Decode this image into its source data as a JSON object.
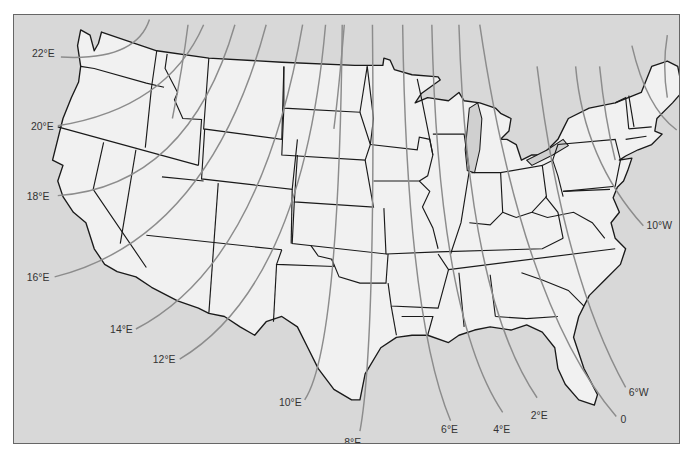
{
  "map": {
    "title": "Magnetic declination (isogonic lines), contiguous United States",
    "colors": {
      "water": "#d8d8d8",
      "land": "#f1f1f1",
      "border": "#1a1a1a",
      "isogonic_line": "#8c8c8c",
      "label": "#333333"
    },
    "isogonic_lines": [
      {
        "id": "22E",
        "label": "22°E",
        "declination_deg": 22,
        "direction": "E"
      },
      {
        "id": "20E",
        "label": "20°E",
        "declination_deg": 20,
        "direction": "E"
      },
      {
        "id": "18E",
        "label": "18°E",
        "declination_deg": 18,
        "direction": "E"
      },
      {
        "id": "16E",
        "label": "16°E",
        "declination_deg": 16,
        "direction": "E"
      },
      {
        "id": "14E",
        "label": "14°E",
        "declination_deg": 14,
        "direction": "E"
      },
      {
        "id": "12E",
        "label": "12°E",
        "declination_deg": 12,
        "direction": "E"
      },
      {
        "id": "10E",
        "label": "10°E",
        "declination_deg": 10,
        "direction": "E"
      },
      {
        "id": "8E",
        "label": "8°E",
        "declination_deg": 8,
        "direction": "E"
      },
      {
        "id": "6E",
        "label": "6°E",
        "declination_deg": 6,
        "direction": "E"
      },
      {
        "id": "4E",
        "label": "4°E",
        "declination_deg": 4,
        "direction": "E"
      },
      {
        "id": "2E",
        "label": "2°E",
        "declination_deg": 2,
        "direction": "E"
      },
      {
        "id": "0",
        "label": "0",
        "declination_deg": 0,
        "direction": ""
      },
      {
        "id": "6W",
        "label": "6°W",
        "declination_deg": 6,
        "direction": "W"
      },
      {
        "id": "10W",
        "label": "10°W",
        "declination_deg": 10,
        "direction": "W"
      },
      {
        "id": "18W",
        "label": "18°W",
        "declination_deg": 18,
        "direction": "W"
      }
    ],
    "unlabeled_lines_count": 6
  }
}
